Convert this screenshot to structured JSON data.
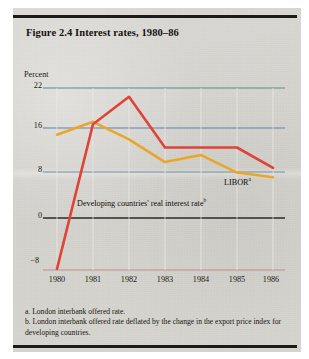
{
  "figure": {
    "title": "Figure 2.4 Interest rates, 1980–86",
    "axis_label_y": "Percent",
    "series_label_libor": "LIBOR",
    "series_label_libor_sup": "a",
    "series_label_developing": "Developing countries' real interest rate",
    "series_label_developing_sup": "b",
    "note_a": "a. London interbank offered rate.",
    "note_b": "b. London interbank offered rate deflated by the change in the export price index for developing countries."
  },
  "colors": {
    "paper": "#d6d4cf",
    "rule": "#1d1b19",
    "gridline_teal": "#4f8f94",
    "gridline_blue": "#5d84ad",
    "gridline_steel": "#6d94a8",
    "zero_line": "#2b2926",
    "baseline_pink": "#c08f8f",
    "series_developing": "#e04338",
    "series_libor": "#eaa62b",
    "text": "#15130f"
  },
  "chart_data": {
    "type": "line",
    "title": "Figure 2.4 Interest rates, 1980–86",
    "xlabel": "",
    "ylabel": "Percent",
    "x": [
      1980,
      1981,
      1982,
      1983,
      1984,
      1985,
      1986
    ],
    "xtick_labels": [
      "1980",
      "1981",
      "1982",
      "1983",
      "1984",
      "1985",
      "1986"
    ],
    "ytick_labels": [
      "22",
      "16",
      "8",
      "0",
      "−8"
    ],
    "ytick_values": [
      22,
      16,
      8,
      0,
      -8
    ],
    "ylim": [
      -10,
      23
    ],
    "xlim": [
      1980,
      1986
    ],
    "grid": true,
    "grid_axis": "y",
    "legend": "inline-annotations",
    "series": [
      {
        "name": "Developing countries' real interest rate",
        "note_ref": "b",
        "color": "#e04338",
        "values": [
          -9.0,
          15.8,
          20.5,
          11.8,
          11.8,
          11.8,
          8.3
        ]
      },
      {
        "name": "LIBOR",
        "note_ref": "a",
        "color": "#eaa62b",
        "values": [
          14.0,
          16.2,
          13.2,
          9.3,
          10.5,
          7.5,
          6.7
        ]
      }
    ],
    "annotations": [
      {
        "text": "LIBOR",
        "sup": "a",
        "x": 1985.0,
        "y": 5.2
      },
      {
        "text": "Developing countries' real interest rate",
        "sup": "b",
        "x": 1981.0,
        "y": 1.6
      }
    ],
    "footnotes": [
      "a. London interbank offered rate.",
      "b. London interbank offered rate deflated by the change in the export price index for developing countries."
    ]
  }
}
